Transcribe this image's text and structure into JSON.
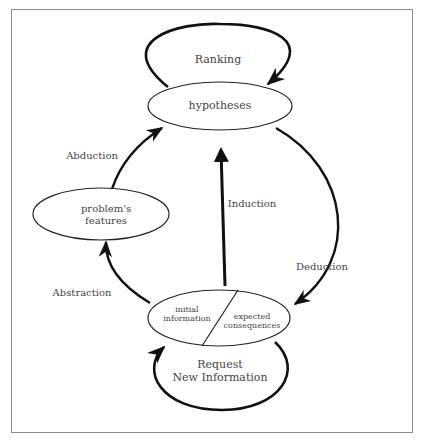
{
  "diagram": {
    "nodes": {
      "hypotheses": "hypotheses",
      "problem_features_line1": "problem's",
      "problem_features_line2": "features",
      "initial_information_line1": "initial",
      "initial_information_line2": "information",
      "expected_consequences_line1": "expected",
      "expected_consequences_line2": "consequences"
    },
    "edges": {
      "ranking": "Ranking",
      "abduction": "Abduction",
      "abstraction": "Abstraction",
      "induction": "Induction",
      "deduction": "Deduction",
      "request_line1": "Request",
      "request_line2": "New Information"
    },
    "colors": {
      "stroke": "#111111",
      "text": "#444444",
      "frame": "#8a8a8a"
    }
  }
}
